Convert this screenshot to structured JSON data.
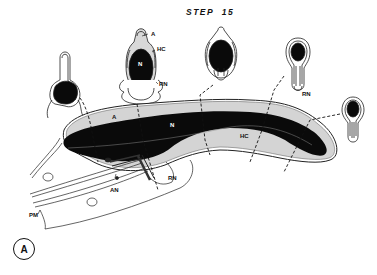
{
  "figure": {
    "title": "STEP 15",
    "panel_label": "A",
    "colors": {
      "nucleus": "#0a0a0a",
      "acrosome": "#d4d4d4",
      "outline": "#222222",
      "background": "#ffffff"
    }
  },
  "cross_sections": [
    {
      "id": "section-1",
      "labels": []
    },
    {
      "id": "section-2",
      "labels": [
        "A",
        "HC",
        "N",
        "RN"
      ]
    },
    {
      "id": "section-3",
      "labels": []
    },
    {
      "id": "section-4",
      "labels": [
        "RN"
      ]
    },
    {
      "id": "section-5",
      "labels": []
    }
  ],
  "labels": {
    "section2_acrosome": "A",
    "section2_head_cap": "HC",
    "section2_nucleus": "N",
    "section2_ring_nucleus": "RN",
    "section4_ring_nucleus": "RN",
    "main_acrosome": "A",
    "main_nucleus": "N",
    "main_head_cap": "HC",
    "main_ring_nucleus": "RN",
    "main_axial_nucleus": "AN",
    "main_plasma_membrane": "PM"
  }
}
